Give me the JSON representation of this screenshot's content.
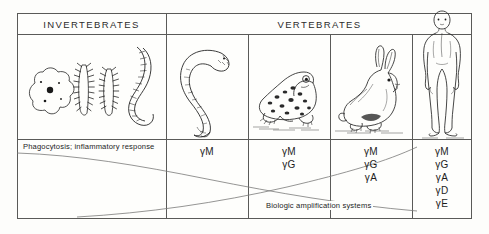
{
  "figure": {
    "title_invertebrates": "INVERTEBRATES",
    "title_vertebrates": "VERTEBRATES",
    "phagocytosis_label": "Phagocytosis; inflammatory response",
    "amplification_label": "Biologic amplification systems",
    "line_color": "#5a5a58",
    "text_color": "#1d1d1d",
    "background": "#fdfdfb"
  },
  "columns": [
    {
      "group": "INVERTEBRATES",
      "organisms": [
        "amoeba",
        "arthropod",
        "arthropod",
        "earthworm"
      ],
      "immunoglobulins": []
    },
    {
      "group": "VERTEBRATES",
      "organisms": [
        "lamprey"
      ],
      "immunoglobulins": [
        "γM"
      ]
    },
    {
      "group": "VERTEBRATES",
      "organisms": [
        "frog"
      ],
      "immunoglobulins": [
        "γM",
        "γG"
      ]
    },
    {
      "group": "VERTEBRATES",
      "organisms": [
        "rabbit"
      ],
      "immunoglobulins": [
        "γM",
        "γG",
        "γA"
      ]
    },
    {
      "group": "VERTEBRATES",
      "organisms": [
        "human"
      ],
      "immunoglobulins": [
        "γM",
        "γG",
        "γA",
        "γD",
        "γE"
      ]
    }
  ],
  "ig_text": {
    "lamprey": "γM",
    "frog_1": "γM",
    "frog_2": "γG",
    "rabbit_1": "γM",
    "rabbit_2": "γG",
    "rabbit_3": "γA",
    "human_1": "γM",
    "human_2": "γG",
    "human_3": "γA",
    "human_4": "γD",
    "human_5": "γE"
  }
}
